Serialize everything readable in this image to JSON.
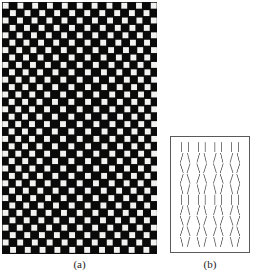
{
  "figure": {
    "background_color": "#ffffff",
    "ink_color": "#0a0a0a",
    "panels": [
      {
        "id": "a",
        "caption": "(a)",
        "type": "distorted-checkerboard",
        "x": 2,
        "y": 2,
        "width": 155,
        "height": 252,
        "background_color": "#0a0a0a",
        "square_color": "#f2f2f0",
        "cell_size": 7.4,
        "columns": 21,
        "rows": 34,
        "square_inset": 1.5,
        "distortion": {
          "kind": "lens-bulge",
          "description": "white squares are progressively displaced outward along a vertical lens-shaped envelope, producing an apparent bulge",
          "center_x_fraction": 0.5,
          "center_y_fraction": 0.5,
          "max_shift_px": 3.4,
          "envelope_power": 1.0
        }
      },
      {
        "id": "b",
        "caption": "(b)",
        "type": "tilted-segment-array",
        "x": 170,
        "y": 136,
        "width": 80,
        "height": 117,
        "background_color": "#ffffff",
        "border_color": "#5a5a5a",
        "border_width": 1,
        "stroke_color": "#6b6b6b",
        "stroke_width": 0.9,
        "segment_length": 9.5,
        "pair_gap": 7.0,
        "columns": 4,
        "rows": 10,
        "row_tilts_deg": [
          {
            "row": 1,
            "left": 0,
            "right": 0,
            "glyph": "||"
          },
          {
            "row": 2,
            "left": -16,
            "right": 14,
            "glyph": "/|"
          },
          {
            "row": 3,
            "left": 18,
            "right": -18,
            "glyph": "\\/"
          },
          {
            "row": 4,
            "left": -18,
            "right": 18,
            "glyph": "/\\"
          },
          {
            "row": 5,
            "left": 14,
            "right": -14,
            "glyph": "\\)"
          },
          {
            "row": 6,
            "left": 0,
            "right": 0,
            "glyph": "||"
          },
          {
            "row": 7,
            "left": -16,
            "right": 14,
            "glyph": "/|"
          },
          {
            "row": 8,
            "left": 18,
            "right": -18,
            "glyph": "\\/"
          },
          {
            "row": 9,
            "left": -18,
            "right": 18,
            "glyph": "/\\"
          },
          {
            "row": 10,
            "left": 14,
            "right": -14,
            "glyph": "\\)"
          }
        ]
      }
    ]
  },
  "captions": {
    "panel_a": "(a)",
    "panel_b": "(b)"
  }
}
